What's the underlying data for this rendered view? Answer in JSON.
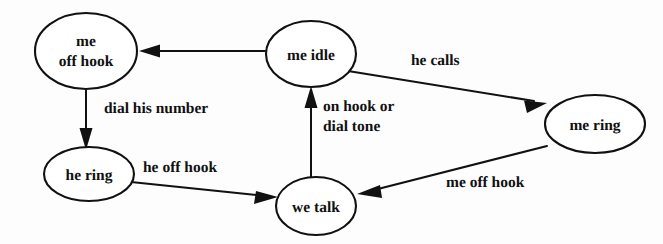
{
  "diagram": {
    "type": "state-transition-diagram",
    "background_color": "#fdfdfd",
    "stroke_color": "#111111",
    "fill_color": "#ffffff",
    "nodes": [
      {
        "id": "me_off_hook",
        "label_line1": "me",
        "label_line2": "off hook",
        "cx": 86,
        "cy": 51,
        "rx": 51,
        "ry": 38
      },
      {
        "id": "me_idle",
        "label_line1": "me idle",
        "label_line2": "",
        "cx": 311,
        "cy": 54,
        "rx": 45,
        "ry": 33
      },
      {
        "id": "me_ring",
        "label_line1": "me ring",
        "label_line2": "",
        "cx": 595,
        "cy": 124,
        "rx": 50,
        "ry": 29
      },
      {
        "id": "he_ring",
        "label_line1": "he ring",
        "label_line2": "",
        "cx": 89,
        "cy": 174,
        "rx": 45,
        "ry": 27
      },
      {
        "id": "we_talk",
        "label_line1": "we talk",
        "label_line2": "",
        "cx": 316,
        "cy": 206,
        "rx": 40,
        "ry": 29
      }
    ],
    "edges": [
      {
        "id": "idle_to_me_off_hook",
        "from": "me_idle",
        "to": "me_off_hook",
        "label": "",
        "label_line2": ""
      },
      {
        "id": "me_off_hook_to_he_ring",
        "from": "me_off_hook",
        "to": "he_ring",
        "label": "dial  his number",
        "label_line2": ""
      },
      {
        "id": "idle_to_me_ring",
        "from": "me_idle",
        "to": "me_ring",
        "label": "he calls",
        "label_line2": ""
      },
      {
        "id": "he_ring_to_we_talk",
        "from": "he_ring",
        "to": "we_talk",
        "label": "he off hook",
        "label_line2": ""
      },
      {
        "id": "me_ring_to_we_talk",
        "from": "me_ring",
        "to": "we_talk",
        "label": "me off hook",
        "label_line2": ""
      },
      {
        "id": "we_talk_to_idle",
        "from": "we_talk",
        "to": "me_idle",
        "label": "on hook or",
        "label_line2": "dial tone"
      }
    ]
  }
}
